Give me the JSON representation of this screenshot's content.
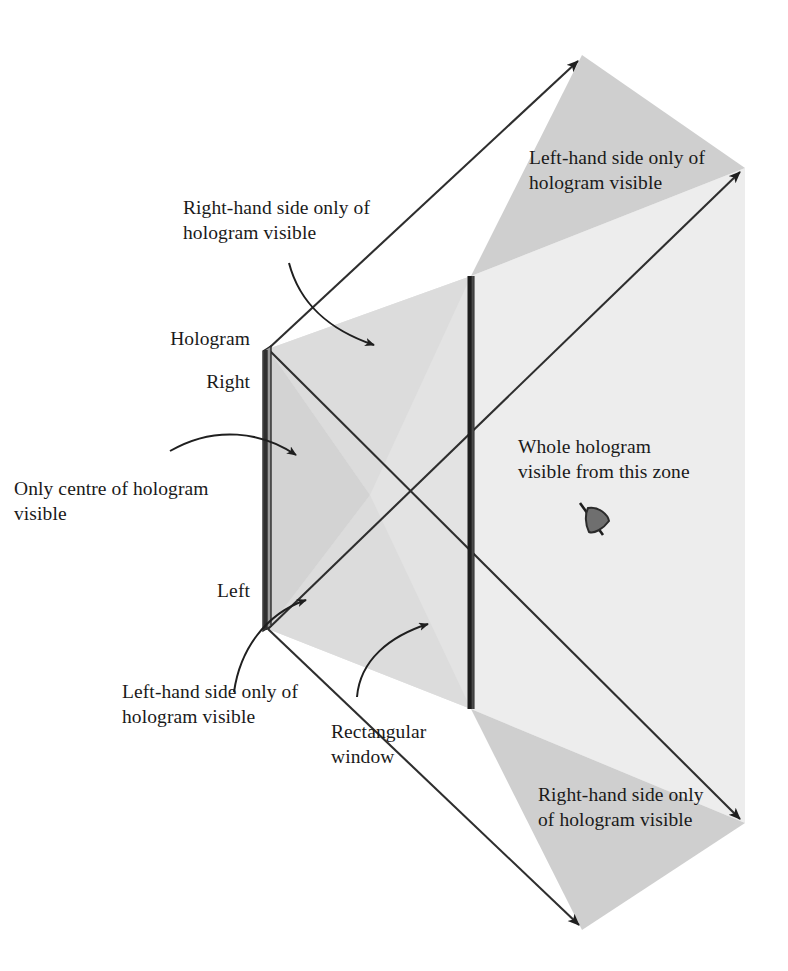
{
  "figure": {
    "type": "diagram",
    "background_color": "#ffffff",
    "line_color": "#262626",
    "fill_light": "#ededed",
    "fill_mid": "#e0e0e0",
    "fill_dark": "#c9c9c9",
    "bar_color": "#2b2b2b"
  },
  "labels": {
    "right_hand_top": "Right-hand side only of\nhologram visible",
    "left_hand_top": "Left-hand side only of\nhologram visible",
    "hologram": "Hologram",
    "right_edge": "Right",
    "left_edge": "Left",
    "only_centre": "Only centre of hologram\nvisible",
    "whole_zone": "Whole hologram\nvisible from this zone",
    "left_hand_bottom": "Left-hand side only of\nhologram visible",
    "rectangular_window": "Rectangular\nwindow",
    "right_hand_bottom": "Right-hand side only\nof hologram visible"
  },
  "icons": {
    "viewer": "eye-viewer-icon"
  },
  "geometry": {
    "hologram_bar": {
      "x": 268,
      "y_top": 349,
      "y_bottom": 629
    },
    "window_bar": {
      "x": 471,
      "y_top": 276,
      "y_bottom": 709
    },
    "rays": [
      {
        "name": "hologram-top-through-window-top",
        "from": [
          268,
          349
        ],
        "to": [
          582,
          55
        ]
      },
      {
        "name": "hologram-bottom-through-window-top",
        "from": [
          268,
          629
        ],
        "to": [
          745,
          168
        ]
      },
      {
        "name": "hologram-top-through-window-bottom",
        "from": [
          268,
          349
        ],
        "to": [
          745,
          823
        ]
      },
      {
        "name": "hologram-bottom-through-window-bottom",
        "from": [
          268,
          629
        ],
        "to": [
          582,
          930
        ]
      }
    ]
  }
}
